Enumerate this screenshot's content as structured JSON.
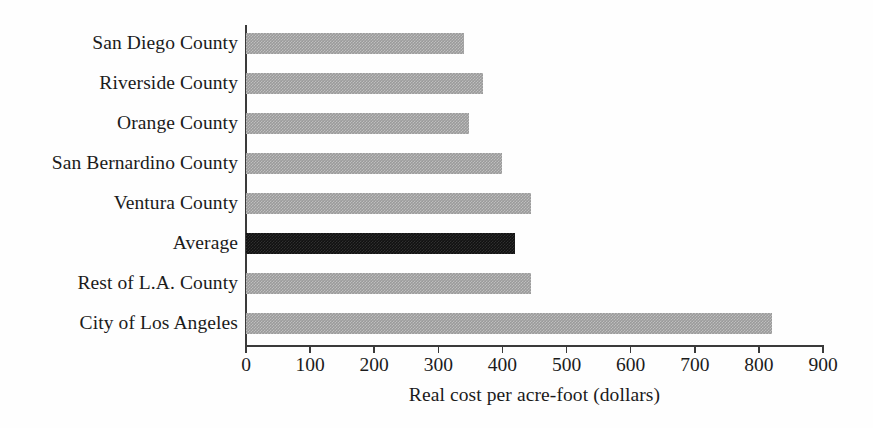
{
  "chart_data": {
    "type": "bar",
    "orientation": "horizontal",
    "title": "",
    "xlabel": "Real cost per acre-foot (dollars)",
    "ylabel": "",
    "xlim": [
      0,
      900
    ],
    "xticks": [
      "0",
      "100",
      "200",
      "300",
      "400",
      "500",
      "600",
      "700",
      "800",
      "900"
    ],
    "xtick_values": [
      0,
      100,
      200,
      300,
      400,
      500,
      600,
      700,
      800,
      900
    ],
    "grid": false,
    "legend": null,
    "categories": [
      "San Diego County",
      "Riverside County",
      "Orange County",
      "San Bernardino County",
      "Ventura County",
      "Average",
      "Rest of L.A. County",
      "City of Los Angeles"
    ],
    "values": [
      340,
      370,
      348,
      400,
      445,
      420,
      445,
      820
    ],
    "bar_styles": [
      "gray",
      "gray",
      "gray",
      "gray",
      "gray",
      "highlight",
      "gray",
      "gray"
    ],
    "colors": {
      "bar_gray": "#9a9a9a",
      "bar_highlight": "#111111",
      "axis": "#3a3a3a",
      "text": "#1b1b1b",
      "background": "#fefefe"
    }
  }
}
